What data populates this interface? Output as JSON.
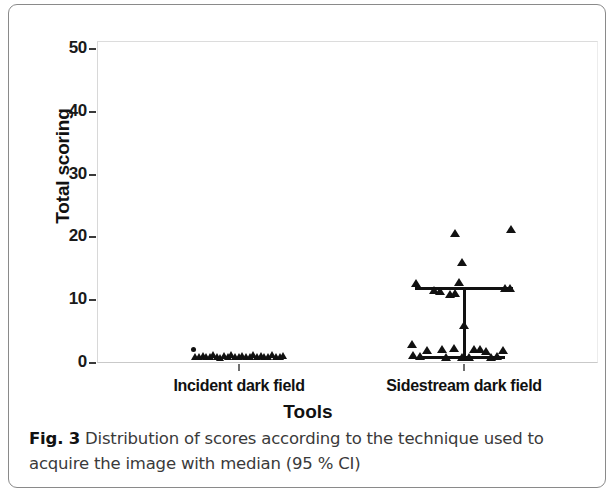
{
  "figure": {
    "caption_label": "Fig. 3",
    "caption_text": " Distribution of scores according to the technique used to acquire the image with median (95 % CI)"
  },
  "chart_data": {
    "type": "scatter",
    "title": "",
    "xlabel": "Tools",
    "ylabel": "Total scoring",
    "categories": [
      "Incident dark field",
      "Sidestream dark field"
    ],
    "yticks": [
      0,
      10,
      20,
      30,
      40,
      50
    ],
    "ylim": [
      0,
      51.3
    ],
    "grid": false,
    "legend": "none",
    "marker": "triangle",
    "series": [
      {
        "name": "Incident dark field",
        "category_index": 0,
        "points": [
          {
            "x_offset": -46,
            "y": 2.3,
            "shape": "dot"
          },
          {
            "x_offset": -44,
            "y": 1.0
          },
          {
            "x_offset": -40,
            "y": 0.9
          },
          {
            "x_offset": -36,
            "y": 1.1
          },
          {
            "x_offset": -33,
            "y": 1.0
          },
          {
            "x_offset": -29,
            "y": 0.9
          },
          {
            "x_offset": -26,
            "y": 1.2
          },
          {
            "x_offset": -22,
            "y": 1.0
          },
          {
            "x_offset": -19,
            "y": 0.8
          },
          {
            "x_offset": -15,
            "y": 1.1
          },
          {
            "x_offset": -11,
            "y": 1.0
          },
          {
            "x_offset": -8,
            "y": 1.2
          },
          {
            "x_offset": -4,
            "y": 0.9
          },
          {
            "x_offset": 0,
            "y": 1.0
          },
          {
            "x_offset": 3,
            "y": 1.1
          },
          {
            "x_offset": 7,
            "y": 1.0
          },
          {
            "x_offset": 11,
            "y": 0.9
          },
          {
            "x_offset": 14,
            "y": 1.2
          },
          {
            "x_offset": 18,
            "y": 1.0
          },
          {
            "x_offset": 22,
            "y": 1.1
          },
          {
            "x_offset": 25,
            "y": 0.9
          },
          {
            "x_offset": 29,
            "y": 1.0
          },
          {
            "x_offset": 33,
            "y": 1.2
          },
          {
            "x_offset": 37,
            "y": 1.0
          },
          {
            "x_offset": 41,
            "y": 0.9
          },
          {
            "x_offset": 44,
            "y": 1.1
          }
        ],
        "median": null,
        "ci_low": null,
        "ci_high": null
      },
      {
        "name": "Sidestream dark field",
        "category_index": 1,
        "points": [
          {
            "x_offset": -9,
            "y": 20.7
          },
          {
            "x_offset": 47,
            "y": 21.3
          },
          {
            "x_offset": -2,
            "y": 16.1
          },
          {
            "x_offset": -48,
            "y": 12.8
          },
          {
            "x_offset": -5,
            "y": 12.9
          },
          {
            "x_offset": 41,
            "y": 12.0
          },
          {
            "x_offset": 46,
            "y": 12.0
          },
          {
            "x_offset": -30,
            "y": 11.6
          },
          {
            "x_offset": -24,
            "y": 11.4
          },
          {
            "x_offset": -14,
            "y": 11.0
          },
          {
            "x_offset": -9,
            "y": 11.2
          },
          {
            "x_offset": -52,
            "y": 3.0
          },
          {
            "x_offset": -51,
            "y": 1.2
          },
          {
            "x_offset": -44,
            "y": 1.1
          },
          {
            "x_offset": -37,
            "y": 2.1
          },
          {
            "x_offset": -22,
            "y": 2.2
          },
          {
            "x_offset": -18,
            "y": 1.0
          },
          {
            "x_offset": -10,
            "y": 2.4
          },
          {
            "x_offset": -2,
            "y": 1.0
          },
          {
            "x_offset": 5,
            "y": 0.9
          },
          {
            "x_offset": 10,
            "y": 2.2
          },
          {
            "x_offset": 16,
            "y": 2.3
          },
          {
            "x_offset": 22,
            "y": 1.9
          },
          {
            "x_offset": 27,
            "y": 1.0
          },
          {
            "x_offset": 33,
            "y": 1.1
          },
          {
            "x_offset": 39,
            "y": 2.0
          }
        ],
        "median": 6.0,
        "ci_low": 1.0,
        "ci_high": 12.0,
        "ci_bar_half_width_px": 49
      }
    ]
  }
}
